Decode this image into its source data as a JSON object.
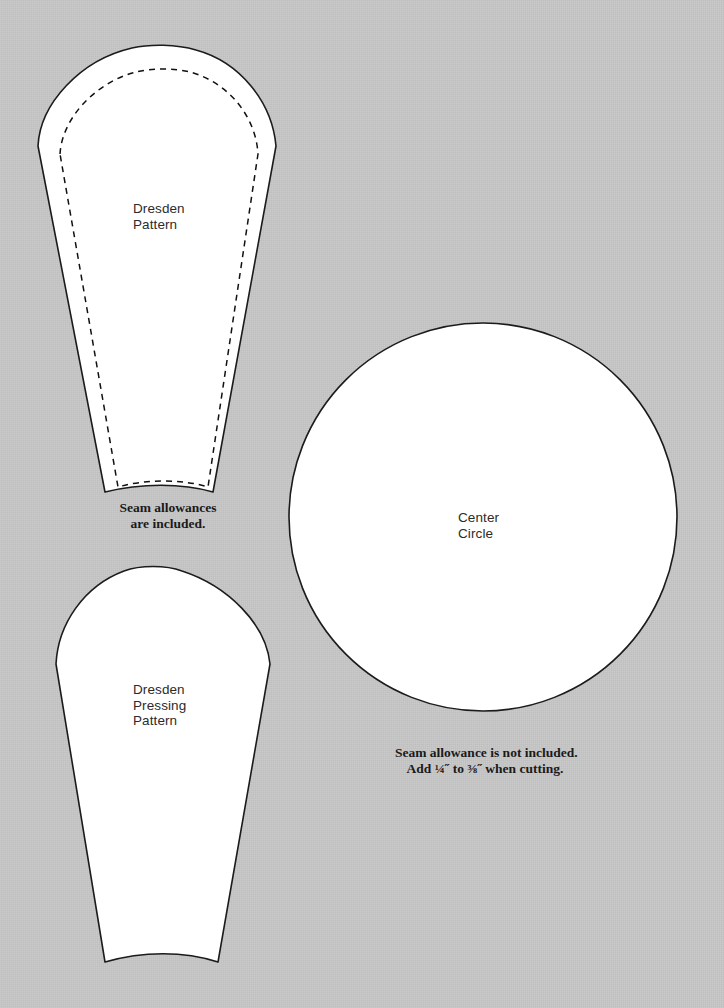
{
  "page": {
    "background_color": "#c6c6c6",
    "ink_color": "#1b1b1b",
    "paper_color": "#ffffff",
    "width": 724,
    "height": 1008
  },
  "pieces": [
    {
      "id": "dresden-pattern",
      "label_line_1": "Dresden",
      "label_line_2": "Pattern",
      "has_stitch_line": true
    },
    {
      "id": "dresden-pressing-pattern",
      "label_line_1": "Dresden",
      "label_line_2": "Pressing",
      "label_line_3": "Pattern",
      "has_stitch_line": false
    },
    {
      "id": "center-circle",
      "label_line_1": "Center",
      "label_line_2": "Circle",
      "has_stitch_line": false
    }
  ],
  "notes": {
    "seam_included_line_1": "Seam allowances",
    "seam_included_line_2": "are included.",
    "seam_not_included_line_1": "Seam allowance is not included.",
    "seam_not_included_line_2": "Add ¼˝ to ⅜˝ when cutting."
  }
}
